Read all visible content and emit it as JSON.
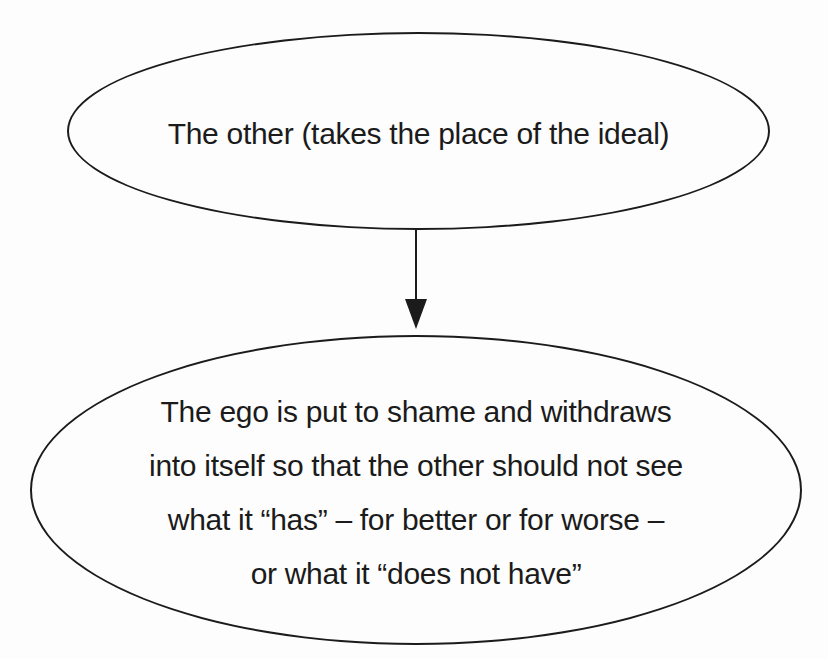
{
  "diagram": {
    "colors": {
      "ink": "#1b1b1b",
      "background": "#fdfdfd"
    },
    "top_node": {
      "text": "The other (takes the place of the ideal)"
    },
    "arrow": {
      "direction": "down",
      "from": "top_node",
      "to": "bottom_node"
    },
    "bottom_node": {
      "lines": [
        "The ego is put to shame and withdraws",
        "into itself so that the other should not see",
        "what it “has” – for better or for worse –",
        "or what it “does not have”"
      ]
    }
  }
}
